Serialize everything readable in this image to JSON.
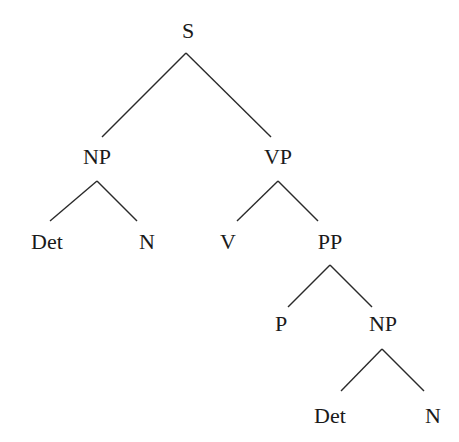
{
  "diagram": {
    "type": "syntax-tree",
    "colors": {
      "line": "#2a2a2a",
      "text": "#1a1a1a",
      "background": "#ffffff"
    },
    "nodes": [
      {
        "id": "S",
        "label": "S",
        "x": 188,
        "y": 20
      },
      {
        "id": "NP1",
        "label": "NP",
        "x": 97,
        "y": 146
      },
      {
        "id": "VP",
        "label": "VP",
        "x": 278,
        "y": 146
      },
      {
        "id": "Det1",
        "label": "Det",
        "x": 47,
        "y": 231
      },
      {
        "id": "N1",
        "label": "N",
        "x": 147,
        "y": 231
      },
      {
        "id": "V",
        "label": "V",
        "x": 228,
        "y": 231
      },
      {
        "id": "PP",
        "label": "PP",
        "x": 330,
        "y": 231
      },
      {
        "id": "P",
        "label": "P",
        "x": 281,
        "y": 313
      },
      {
        "id": "NP2",
        "label": "NP",
        "x": 383,
        "y": 313
      },
      {
        "id": "Det2",
        "label": "Det",
        "x": 330,
        "y": 405
      },
      {
        "id": "N2",
        "label": "N",
        "x": 433,
        "y": 405
      }
    ],
    "edges": [
      {
        "from": "S",
        "to": "NP1",
        "x1": 186,
        "y1": 53,
        "x2": 102,
        "y2": 137
      },
      {
        "from": "S",
        "to": "VP",
        "x1": 186,
        "y1": 53,
        "x2": 271,
        "y2": 137
      },
      {
        "from": "NP1",
        "to": "Det1",
        "x1": 97,
        "y1": 181,
        "x2": 50,
        "y2": 221
      },
      {
        "from": "NP1",
        "to": "N1",
        "x1": 97,
        "y1": 181,
        "x2": 137,
        "y2": 221
      },
      {
        "from": "VP",
        "to": "V",
        "x1": 278,
        "y1": 181,
        "x2": 237,
        "y2": 221
      },
      {
        "from": "VP",
        "to": "PP",
        "x1": 278,
        "y1": 181,
        "x2": 318,
        "y2": 221
      },
      {
        "from": "PP",
        "to": "P",
        "x1": 330,
        "y1": 265,
        "x2": 288,
        "y2": 307
      },
      {
        "from": "PP",
        "to": "NP2",
        "x1": 330,
        "y1": 265,
        "x2": 372,
        "y2": 307
      },
      {
        "from": "NP2",
        "to": "Det2",
        "x1": 382,
        "y1": 349,
        "x2": 341,
        "y2": 391
      },
      {
        "from": "NP2",
        "to": "N2",
        "x1": 382,
        "y1": 349,
        "x2": 424,
        "y2": 391
      }
    ]
  }
}
